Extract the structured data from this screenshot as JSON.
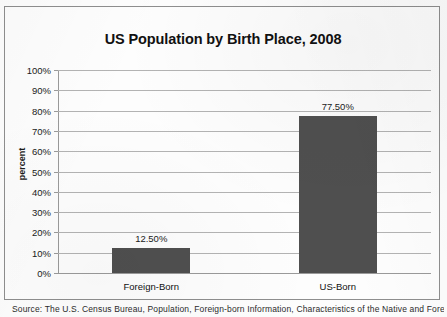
{
  "chart_data": {
    "type": "bar",
    "title": "US Population by Birth Place, 2008",
    "xlabel": "",
    "ylabel": "percent",
    "categories": [
      "Foreign-Born",
      "US-Born"
    ],
    "values": [
      12.5,
      77.5
    ],
    "value_labels": [
      "12.50%",
      "77.50%"
    ],
    "ylim": [
      0,
      100
    ],
    "ytick_values": [
      100,
      90,
      80,
      70,
      60,
      50,
      40,
      30,
      20,
      10,
      0
    ],
    "ytick_labels": [
      "100%",
      "90%",
      "80%",
      "70%",
      "60%",
      "50%",
      "40%",
      "30%",
      "20%",
      "10%",
      "0%"
    ],
    "grid": true,
    "legend": false,
    "legend_position": "none",
    "bar_color": "#4f4f4f",
    "gridline_color": "#b3b3b3",
    "axis_color": "#9a9a9a",
    "background_color": "#fdfdfd",
    "text_color": "#1a1a1a"
  },
  "caption": {
    "text": "Source: The U.S. Census Bureau, Population, Foreign-born Information, Characteristics of the Native and Foreign-born"
  }
}
